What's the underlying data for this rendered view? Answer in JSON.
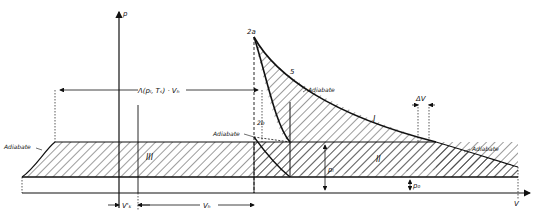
{
  "diagram": {
    "type": "pV-diagram",
    "axes": {
      "y_label": "p",
      "x_label": "V"
    },
    "point_labels": {
      "top": "2a",
      "point5": "5",
      "lower": "2b"
    },
    "curve_labels": {
      "adiabat_upper": "Adiabate",
      "adiabat_mid_left": "Adiabate",
      "adiabat_right": "Adiabate",
      "adiabat_far_left": "Adiabate"
    },
    "regions": {
      "region1": "I",
      "region2": "II",
      "region3": "III"
    },
    "dimensions": {
      "lambda_vh": "Λ(pₗ, Tₛ) · Vₕ",
      "delta_v": "ΔV",
      "p_l": "pₗ",
      "p_0": "p₀",
      "v_k": "V'ₖ",
      "v_h": "Vₕ"
    },
    "colors": {
      "line": "#111111",
      "background": "#ffffff"
    }
  }
}
